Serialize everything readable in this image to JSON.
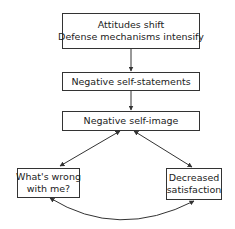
{
  "diagram": {
    "type": "flowchart",
    "nodes": [
      {
        "id": "n1",
        "lines": [
          "Attitudes shift",
          "Defense mechanisms intensify"
        ]
      },
      {
        "id": "n2",
        "lines": [
          "Negative self-statements"
        ]
      },
      {
        "id": "n3",
        "lines": [
          "Negative self-image"
        ]
      },
      {
        "id": "n4",
        "lines": [
          "What's wrong",
          "with me?"
        ]
      },
      {
        "id": "n5",
        "lines": [
          "Decreased",
          "satisfaction"
        ]
      }
    ],
    "edges": [
      {
        "from": "n1",
        "to": "n2",
        "direction": "forward"
      },
      {
        "from": "n2",
        "to": "n3",
        "direction": "forward"
      },
      {
        "from": "n3",
        "to": "n4",
        "direction": "bidirectional"
      },
      {
        "from": "n3",
        "to": "n5",
        "direction": "bidirectional"
      },
      {
        "from": "n4",
        "to": "n5",
        "direction": "bidirectional",
        "style": "curved"
      }
    ],
    "colors": {
      "line": "#333333",
      "background": "#ffffff",
      "text": "#222222"
    }
  }
}
